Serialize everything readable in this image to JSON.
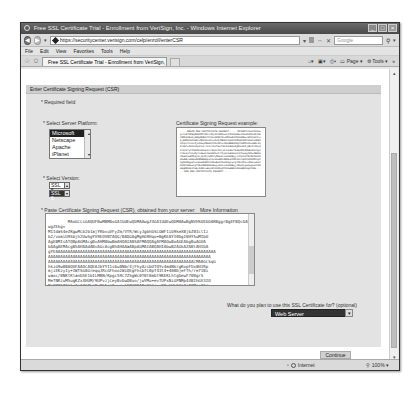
{
  "window": {
    "title": "Free SSL Certificate Trial - Enrollment from VeriSign, Inc. - Windows Internet Explorer",
    "controls": [
      "minimize",
      "maximize",
      "close"
    ]
  },
  "addressbar": {
    "url": "https://securitycenter.verisign.com/celp/enroll/enterCSR",
    "search_placeholder": "Google"
  },
  "menubar": {
    "items": [
      "File",
      "Edit",
      "View",
      "Favorites",
      "Tools",
      "Help"
    ]
  },
  "tabs": {
    "active_tab": "Free SSL Certificate Trial - Enrollment from VeriSign, Inc."
  },
  "commandbar": {
    "items": [
      "Home",
      "Feeds",
      "Print",
      "Page",
      "Tools"
    ]
  },
  "page": {
    "section_title": "Enter Certificate Signing Request (CSR)",
    "required_note": "* Required field",
    "platform_label": "* Select Server Platform:",
    "platforms": [
      "Microsoft",
      "Netscape",
      "Apache",
      "iPlanet"
    ],
    "selected_platform": "Microsoft",
    "version_label": "* Select Version:",
    "versions": [
      "SSL 5",
      "SSL 6"
    ],
    "selected_version": "SSL 6",
    "example_label": "Certificate Signing Request example:",
    "example_text": "-----BEGIN NEW CERTIFICATE REQUEST----- MIIDBTCCAm4CAQAwgcYxETAPBgNVBAMTCHRlc3RjZXJ0MQswCQYDVQQGEwJVUzELMAkGA1UECBMCQ0ExEjAQBgNVBAcTCU1vdW50YWluMRIwEAYDVQQKEwlWZXJpU2lnbjEQMA4GA1UECxMHVGVzdGluZzEfMB0GCSqGSIb3DQEJARYQdGVzdEB2ZXJpc2lnbi5jb20wgZ8wDQYJKoZIhvcNAQEBBQADgY0AMIGJAoGBAL3q8fHmYz5d2kX9pQ7wLr4nVcJ2sT6uYhBfK1mE0aZgN3xWoPjD8cRtS5vQ2lUiO7yF4bHkMnA9eGzIrC6qXsTd1jWfL0uBvY3oKpN5hZ8mEaR2cQgJ4tDxOs7nViMy1lA6wHfUe9bKSzPrT3jGCAwEAAaCCATkwGgYKKwYBBAGCNw0CAzEMFgo1LjEuMjYwMC4yMHsGCisGAQQBgjcCAQ4xbTBrMA4GA1UdDwEB/wQEAwIE8DBEBgkqhkiG9w0BCQ8ENzA1MA4GCCqGSIb3DQMCAgIAgDAOBggqhkiG9w0DBAICAIAwBwYFKw4DAgcwCgYIKoZIhvcNAwcwEwYDVR0lBAwwCgYIKwYBBQUHAwEwgf0GCisGAQQBgjcNAgIxge4wgesCAQEeWgBNAGkAYwByAG8AcwBvAGYAdAAgAFIAUwBBACAAUwBDAGgAYQBu -----END NEW CERTIFICATE REQUEST-----",
    "csr_label": "* Paste Certificate Signing Request (CSR), obtained from your server:",
    "more_info_link": "More Information",
    "csr_value": "MAoGCCsGAQUFBwMBMAoGA1UdEwQDMAAwgZ4GA1UdEwQDMAAwBgNVHSUEDDAKBggrBgEFBQcDAQwgZEkgv\nMIIdaS4eZKgwMCb2b1ajYRbvuVFyZm/VTR/WcyJgbhDSCGWF1iD9keXBjbZ0IclIz\nb2/vomiU9Sbjh2UwSgYV9EOVBfAQG/BAQGAgMgHG9Hqo+BgKEAYI0DgI0HYSuMIbU\nAgEBMIsATQBpAGMAcgBvAHMAbwBmAHQAIABSAFMAQQAgAFMAQwBoAGEAbgBuAGUA\nbAAgAEMAcgB5AHAAdABvAGcAcgBhAHAAaABpAGMAIABQAHIAbwB2AGkAZABlAHIDA\ngYEAAAAAAAAAAAAAAAAAAAAAAAAAAAAAAAAAAAAAAAAAAAAAAAAAAAAAAAAAAAAAAAAA\nAAAAAAAAAAAAAAAAAAAAAAAAAAAAAAAAAAAAAAAAAAAAAAAAAAAAAAAAAAAAAAAAAA\nAAAAAAAAAAAAAAAAAAAAAAAAAAAAAAAAAAAAAAAAAAAAAAAAAAAAAAAAAAACMA0GCSqG\nhkiG9w0BAQUFAAOCAQEAJbYYI1s6u0N6r4jFhyAzsbUTQYv4mdNkrgKopFUx8H1Rp\nmjiEKzyIy+IWTSG8GreqqJRcGFhoo2WiQEgFhsbfC0pT43t4+400DjeFTh/re71Bi\nwaoc/0NKtKlanD5E1bILMBN/Kpgc59C7Z5gWc0T0t8mDt9KEKLhtgDewF700grS\nMeTNRzuM5ugKZx4HUM/9UPvzjCeyBvDwQBuo/jwYMu+evTUPxNiGPNMp44BIhGV3IO\nMcYOKFf0CtqIn24lPLjBxBbDca0vvqulYTWOBIBcXGGqyu99u6WLDHi8pT8MqsAFr\nYMzr1LiAsPNrVFRHcXcKjcJ5dm0rTclDM4U8rNA6Lbg==\n-----END NEW CERTIFICATE REQUEST-----",
    "use_label": "What do you plan to use this SSL Certificate for? (optional)",
    "use_selected": "Web Server",
    "continue_label": "Continue"
  },
  "statusbar": {
    "zone": "Internet",
    "zoom": "100%"
  }
}
